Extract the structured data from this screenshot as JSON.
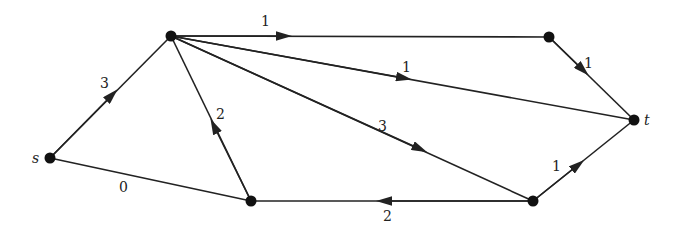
{
  "diagram": {
    "type": "directed-graph",
    "nodes": [
      {
        "id": "s",
        "label": "s",
        "x": 50,
        "y": 158
      },
      {
        "id": "a",
        "label": "",
        "x": 171,
        "y": 36
      },
      {
        "id": "b",
        "label": "",
        "x": 549,
        "y": 37
      },
      {
        "id": "t",
        "label": "t",
        "x": 634,
        "y": 120
      },
      {
        "id": "c",
        "label": "",
        "x": 533,
        "y": 201
      },
      {
        "id": "d",
        "label": "",
        "x": 251,
        "y": 201
      }
    ],
    "edges": [
      {
        "from": "s",
        "to": "a",
        "weight": "3"
      },
      {
        "from": "s",
        "to": "d",
        "weight": "0"
      },
      {
        "from": "d",
        "to": "a",
        "weight": "2"
      },
      {
        "from": "a",
        "to": "b",
        "weight": "1"
      },
      {
        "from": "a",
        "to": "t",
        "weight": "1"
      },
      {
        "from": "a",
        "to": "c",
        "weight": "3"
      },
      {
        "from": "b",
        "to": "t",
        "weight": "1"
      },
      {
        "from": "c",
        "to": "t",
        "weight": "1"
      },
      {
        "from": "c",
        "to": "d",
        "weight": "2"
      }
    ]
  }
}
